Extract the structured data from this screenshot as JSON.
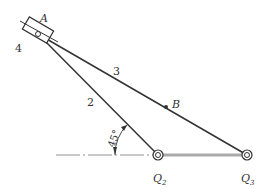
{
  "figure": {
    "type": "mechanism",
    "labels": {
      "point_a": "A",
      "point_b": "B",
      "pivot_o2": "Q",
      "pivot_o2_sub": "2",
      "pivot_o3": "Q",
      "pivot_o3_sub": "3",
      "link_2": "2",
      "link_3": "3",
      "link_4": "4",
      "angle": "45°"
    },
    "colors": {
      "line": "#333333",
      "ground": "#999999"
    }
  }
}
